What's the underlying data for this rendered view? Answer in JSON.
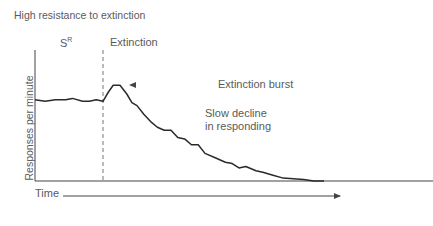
{
  "title": "High resistance to extinction",
  "phases": {
    "reinforcement_label": "S",
    "reinforcement_superscript": "R",
    "extinction_label": "Extinction"
  },
  "annotations": {
    "burst": "Extinction burst",
    "decline_line1": "Slow decline",
    "decline_line2": "in responding"
  },
  "axes": {
    "ylabel": "Responses per minute",
    "xlabel": "Time"
  },
  "colors": {
    "axis": "#444444",
    "curve": "#2a2a2a",
    "dashed": "#777777",
    "text": "#5a5a5a"
  },
  "curve": {
    "description": "Stable responding during reinforcement (SR), brief extinction burst after switch to extinction, then slow gradual decline to zero",
    "points_time_rate": [
      [
        0,
        0.56
      ],
      [
        3,
        0.55
      ],
      [
        6,
        0.56
      ],
      [
        9,
        0.56
      ],
      [
        11,
        0.57
      ],
      [
        14,
        0.55
      ],
      [
        16,
        0.55
      ],
      [
        18,
        0.56
      ],
      [
        20,
        0.55
      ],
      [
        21.5,
        0.61
      ],
      [
        23,
        0.66
      ],
      [
        25,
        0.66
      ],
      [
        27,
        0.6
      ],
      [
        28.5,
        0.54
      ],
      [
        30,
        0.52
      ],
      [
        32,
        0.46
      ],
      [
        34,
        0.41
      ],
      [
        36,
        0.37
      ],
      [
        38,
        0.35
      ],
      [
        40,
        0.35
      ],
      [
        42,
        0.3
      ],
      [
        44,
        0.29
      ],
      [
        46,
        0.25
      ],
      [
        48,
        0.25
      ],
      [
        50,
        0.19
      ],
      [
        53,
        0.16
      ],
      [
        56,
        0.13
      ],
      [
        58,
        0.12
      ],
      [
        60,
        0.09
      ],
      [
        62,
        0.1
      ],
      [
        65,
        0.07
      ],
      [
        67,
        0.06
      ],
      [
        70,
        0.04
      ],
      [
        73,
        0.02
      ],
      [
        76,
        0.015
      ],
      [
        79,
        0.01
      ],
      [
        82,
        0.0
      ],
      [
        85,
        0.0
      ]
    ],
    "extinction_start_time": 20
  }
}
